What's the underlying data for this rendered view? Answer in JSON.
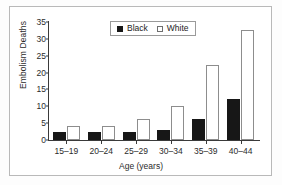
{
  "chart_data": {
    "type": "bar",
    "title": "",
    "xlabel": "Age (years)",
    "ylabel": "Embolism Deaths",
    "categories": [
      "15–19",
      "20–24",
      "25–29",
      "30–34",
      "35–39",
      "40–44"
    ],
    "series": [
      {
        "name": "Black",
        "color": "#171717",
        "values": [
          2.5,
          2.5,
          2.5,
          3.0,
          6.3,
          12.3
        ]
      },
      {
        "name": "White",
        "color": "#ffffff",
        "values": [
          4.2,
          4.2,
          6.2,
          10.2,
          22.3,
          32.7
        ]
      }
    ],
    "ylim": [
      0,
      35
    ],
    "yticks": [
      0,
      5,
      10,
      15,
      20,
      25,
      30,
      35
    ],
    "ytick_labels": [
      "0",
      "5",
      "10",
      "15",
      "20",
      "25",
      "30",
      "35"
    ],
    "grid": false,
    "legend_position": "upper center inside",
    "legend_entries": [
      "Black",
      "White"
    ]
  }
}
